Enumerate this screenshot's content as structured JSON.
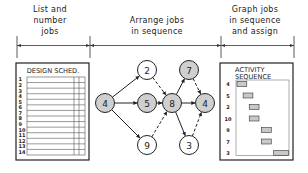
{
  "headers": [
    {
      "lines": [
        "List and",
        "number",
        "jobs"
      ]
    },
    {
      "lines": [
        "Arrange jobs",
        "in sequence"
      ]
    },
    {
      "lines": [
        "Graph jobs",
        "in sequence",
        "and assign"
      ]
    }
  ],
  "schedule": {
    "title": "DESIGN SCHED.",
    "rows": [
      "1",
      "2",
      "3",
      "4",
      "5",
      "6",
      "7",
      "8",
      "9",
      "10",
      "11",
      "12",
      "13",
      "14"
    ]
  },
  "network": {
    "nodes": [
      {
        "id": "a",
        "label": "4",
        "shaded": true
      },
      {
        "id": "b",
        "label": "2",
        "shaded": false
      },
      {
        "id": "c",
        "label": "5",
        "shaded": true
      },
      {
        "id": "d",
        "label": "9",
        "shaded": false
      },
      {
        "id": "e",
        "label": "8",
        "shaded": true
      },
      {
        "id": "f",
        "label": "7",
        "shaded": true
      },
      {
        "id": "g",
        "label": "3",
        "shaded": false
      },
      {
        "id": "h",
        "label": "4",
        "shaded": true
      }
    ],
    "edges": [
      {
        "from": "a",
        "to": "b",
        "dashed": false
      },
      {
        "from": "a",
        "to": "c",
        "dashed": false
      },
      {
        "from": "a",
        "to": "d",
        "dashed": false
      },
      {
        "from": "b",
        "to": "e",
        "dashed": true
      },
      {
        "from": "c",
        "to": "e",
        "dashed": false
      },
      {
        "from": "d",
        "to": "e",
        "dashed": true
      },
      {
        "from": "e",
        "to": "f",
        "dashed": false
      },
      {
        "from": "e",
        "to": "h",
        "dashed": false
      },
      {
        "from": "e",
        "to": "g",
        "dashed": false
      },
      {
        "from": "f",
        "to": "h",
        "dashed": true
      },
      {
        "from": "g",
        "to": "h",
        "dashed": true
      }
    ],
    "colors": {
      "shaded": "#cfcfcf",
      "plain": "#ffffff",
      "stroke": "#222222"
    }
  },
  "activity": {
    "title_lines": [
      "ACTIVITY",
      "SEQUENCE"
    ],
    "bar_color": "#c8c8c8"
  },
  "chart_data": {
    "type": "gantt",
    "title": "ACTIVITY SEQUENCE",
    "categories": [
      "4",
      "5",
      "2",
      "10",
      "9",
      "7",
      "3"
    ],
    "series": [
      {
        "name": "start",
        "values": [
          0,
          1,
          2,
          2,
          4,
          4,
          6
        ]
      },
      {
        "name": "duration",
        "values": [
          1.6,
          1.6,
          1.6,
          1.6,
          1.6,
          1.6,
          2.4
        ]
      }
    ],
    "xlim": [
      0,
      8.5
    ],
    "xlabel": "",
    "ylabel": ""
  }
}
